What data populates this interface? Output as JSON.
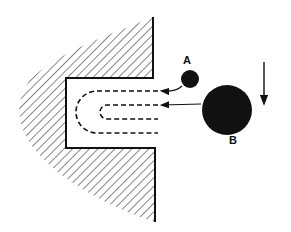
{
  "diagram": {
    "labels": {
      "a": "A",
      "b": "B"
    },
    "colors": {
      "ink": "#111111",
      "background": "#ffffff"
    },
    "elements": {
      "wall": "hatched-wall-with-slot",
      "slot": "rectangular-slot",
      "flow_paths": "dashed-u-shaped-paths",
      "particle_a": "small-filled-circle",
      "particle_b": "large-filled-circle",
      "direction_arrow": "down-arrow"
    }
  }
}
